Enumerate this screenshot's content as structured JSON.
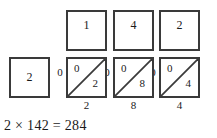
{
  "diagram": {
    "type": "lattice-multiplication",
    "multiplicand_digits": [
      "1",
      "4",
      "2"
    ],
    "multiplier_digits": [
      "2"
    ],
    "carry_labels": [
      "0",
      "0",
      "0"
    ],
    "lattice_cells": [
      {
        "tens": "0",
        "ones": "2"
      },
      {
        "tens": "0",
        "ones": "8"
      },
      {
        "tens": "0",
        "ones": "4"
      }
    ],
    "product_digits": [
      "2",
      "8",
      "4"
    ],
    "equation": "2 × 142 = 284",
    "colors": {
      "border": "#3a3a3a",
      "diagonal": "#3a3a3a",
      "text": "#1a1a1a",
      "background": "#ffffff"
    }
  }
}
